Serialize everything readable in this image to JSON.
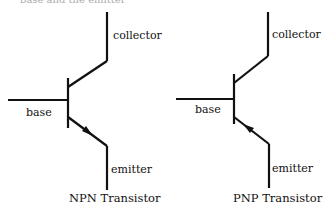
{
  "top_caption_cropped": "base and the emitter",
  "diagrams": [
    {
      "title": "NPN Transistor",
      "labels": {
        "collector": "collector",
        "base": "base",
        "emitter": "emitter"
      },
      "arrow_direction": "outward"
    },
    {
      "title": "PNP Transistor",
      "labels": {
        "collector": "collector",
        "base": "base",
        "emitter": "emitter"
      },
      "arrow_direction": "inward"
    }
  ],
  "colors": {
    "line": "#111111",
    "background": "#ffffff"
  }
}
